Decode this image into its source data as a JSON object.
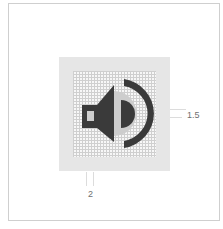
{
  "figure": {
    "icon": "speaker-volume-icon",
    "colors": {
      "frame_border": "#cfcfcf",
      "icon_background": "#e6e6e6",
      "grid_line": "#cfcfcf",
      "glyph_dark": "#3a3a3a",
      "glyph_light": "#cdcdcd"
    }
  },
  "dimensions": {
    "right_label": "1.5",
    "bottom_label": "2"
  }
}
